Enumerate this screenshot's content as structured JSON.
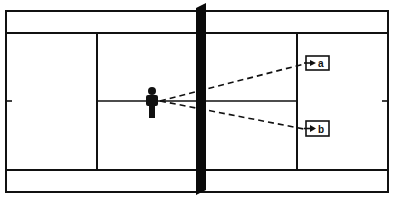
{
  "diagram": {
    "type": "tennis-court-top-view",
    "colors": {
      "line": "#111111",
      "net": "#0a0a0a",
      "background": "#ffffff"
    },
    "court": {
      "outer": {
        "x": 6,
        "y": 11,
        "w": 382,
        "h": 181
      },
      "alley_top_y": 33,
      "alley_bottom_y": 170,
      "service_line_left_x": 97,
      "service_line_right_x": 297,
      "center_line_y": 101
    },
    "net": {
      "x_top": 200,
      "x_bottom": 200,
      "y_top": 3,
      "y_bottom": 195,
      "width": 11
    },
    "player": {
      "label": "player",
      "x": 152,
      "y": 101
    },
    "targets": [
      {
        "id": "a",
        "label": "a",
        "box": {
          "x": 306,
          "y": 56,
          "w": 23,
          "h": 14
        },
        "line_from": {
          "x": 160,
          "y": 101
        },
        "line_to": {
          "x": 306,
          "y": 64
        }
      },
      {
        "id": "b",
        "label": "b",
        "box": {
          "x": 306,
          "y": 121,
          "w": 23,
          "h": 15
        },
        "line_from": {
          "x": 160,
          "y": 101
        },
        "line_to": {
          "x": 306,
          "y": 129
        }
      }
    ]
  }
}
